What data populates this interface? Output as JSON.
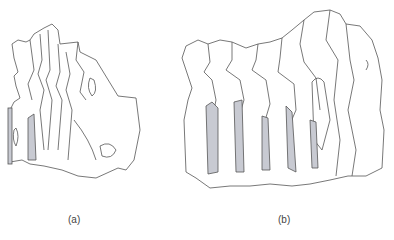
{
  "figure": {
    "panels": [
      {
        "id": "a",
        "label": "(a)",
        "description": "Vertebral column segment, oblique lateral view with shaded intervertebral gaps"
      },
      {
        "id": "b",
        "label": "(b)",
        "description": "Vertebral column segment, lateral view with shaded intervertebral spaces"
      }
    ],
    "colors": {
      "outline": "#555555",
      "shading": "#c8cad2",
      "background": "#ffffff"
    }
  }
}
